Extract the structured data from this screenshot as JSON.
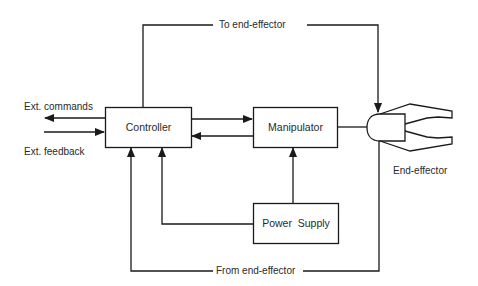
{
  "diagram": {
    "type": "block-diagram",
    "blocks": {
      "controller": {
        "label": "Controller"
      },
      "manipulator": {
        "label": "Manipulator"
      },
      "power_supply": {
        "label": "Power  Supply"
      },
      "end_effector": {
        "label": "End-effector",
        "icon": "gripper-icon"
      }
    },
    "signals": {
      "ext_commands": "Ext. commands",
      "ext_feedback": "Ext. feedback",
      "to_end_effector": "To end-effector",
      "from_end_effector": "From end-effector"
    },
    "connections": [
      {
        "from": "Controller",
        "to": "External",
        "label": "Ext. commands"
      },
      {
        "from": "External",
        "to": "Controller",
        "label": "Ext. feedback"
      },
      {
        "from": "Controller",
        "to": "Manipulator"
      },
      {
        "from": "Manipulator",
        "to": "Controller"
      },
      {
        "from": "Power Supply",
        "to": "Manipulator"
      },
      {
        "from": "Power Supply",
        "to": "Controller"
      },
      {
        "from": "Manipulator",
        "to": "End-effector"
      },
      {
        "from": "Controller",
        "to": "End-effector",
        "label": "To end-effector"
      },
      {
        "from": "End-effector",
        "to": "Controller",
        "label": "From end-effector"
      }
    ],
    "colors": {
      "line": "#1a1a1a",
      "background": "#ffffff"
    }
  }
}
